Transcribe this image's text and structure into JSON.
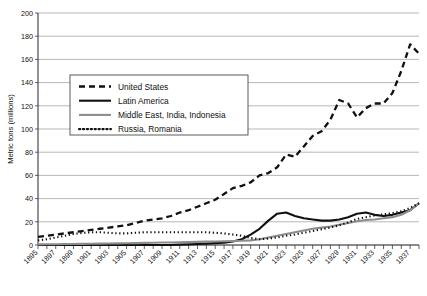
{
  "chart_data": {
    "type": "line",
    "title": "",
    "xlabel": "",
    "ylabel": "Metric tons (millions)",
    "ylim": [
      0,
      200
    ],
    "ytick_step": 20,
    "yticks": [
      "0",
      "20",
      "40",
      "60",
      "80",
      "100",
      "120",
      "140",
      "160",
      "180",
      "200"
    ],
    "xlim": [
      1895,
      1938
    ],
    "grid": "horizontal",
    "legend_position": "upper-left-inside",
    "x": [
      1895,
      1896,
      1897,
      1898,
      1899,
      1900,
      1901,
      1902,
      1903,
      1904,
      1905,
      1906,
      1907,
      1908,
      1909,
      1910,
      1911,
      1912,
      1913,
      1914,
      1915,
      1916,
      1917,
      1918,
      1919,
      1920,
      1921,
      1922,
      1923,
      1924,
      1925,
      1926,
      1927,
      1928,
      1929,
      1930,
      1931,
      1932,
      1933,
      1934,
      1935,
      1936,
      1937,
      1938
    ],
    "xtick_labels": [
      "1895",
      "1897",
      "1899",
      "1901",
      "1903",
      "1905",
      "1907",
      "1909",
      "1911",
      "1913",
      "1915",
      "1917",
      "1919",
      "1921",
      "1923",
      "1925",
      "1927",
      "1929",
      "1931",
      "1933",
      "1935",
      "1937"
    ],
    "series": [
      {
        "name": "United States",
        "style": "dashed",
        "color": "#111111",
        "width": 2.3,
        "dash": "6,4",
        "values": [
          7,
          8,
          9,
          10,
          11,
          12,
          13,
          14,
          15,
          16,
          17,
          19,
          21,
          22,
          23,
          25,
          28,
          30,
          33,
          36,
          39,
          44,
          49,
          51,
          54,
          60,
          62,
          67,
          78,
          76,
          85,
          94,
          98,
          108,
          125,
          122,
          110,
          118,
          122,
          122,
          131,
          150,
          173,
          165
        ]
      },
      {
        "name": "Latin America",
        "style": "solid",
        "color": "#111111",
        "width": 2.1,
        "dash": "",
        "values": [
          0,
          0,
          0,
          0,
          0,
          0,
          0,
          0,
          0,
          0,
          0,
          0,
          0,
          0,
          0,
          0,
          0.3,
          0.5,
          0.8,
          1.2,
          1.6,
          2,
          3,
          5,
          9,
          14,
          21,
          27,
          28,
          25,
          23,
          22,
          21,
          21,
          22,
          24,
          27,
          28,
          26,
          25,
          26,
          28,
          30,
          36
        ]
      },
      {
        "name": "Middle East, India, Indonesia",
        "style": "solid",
        "color": "#8c8c8c",
        "width": 2.1,
        "dash": "",
        "values": [
          0.5,
          0.6,
          0.7,
          0.8,
          0.9,
          1,
          1.1,
          1.2,
          1.3,
          1.4,
          1.5,
          1.6,
          1.8,
          2,
          2.1,
          2.2,
          2.3,
          2.5,
          2.7,
          2.9,
          3,
          3.2,
          3.4,
          3.6,
          4,
          5,
          6.5,
          8,
          9.5,
          11,
          12.5,
          14,
          15,
          16,
          17.5,
          19,
          20.5,
          21.5,
          22,
          23,
          24,
          26,
          30,
          36
        ]
      },
      {
        "name": "Russia, Romania",
        "style": "dotted",
        "color": "#111111",
        "width": 2.1,
        "dash": "1.3,2.6",
        "values": [
          4,
          5,
          6.5,
          8,
          9.5,
          10.5,
          11,
          11,
          10.5,
          10,
          10,
          10.5,
          11,
          11,
          11,
          11,
          11,
          11,
          11,
          11,
          10.5,
          10,
          9,
          8,
          6,
          5,
          5.5,
          6.5,
          8,
          9,
          10.5,
          12,
          13.5,
          15,
          17,
          19.5,
          22.5,
          24,
          25.5,
          26.5,
          27.5,
          29,
          32,
          36
        ]
      }
    ]
  },
  "legend": {
    "items": [
      {
        "label": "United States"
      },
      {
        "label": "Latin America"
      },
      {
        "label": "Middle East, India, Indonesia"
      },
      {
        "label": "Russia, Romania"
      }
    ]
  }
}
